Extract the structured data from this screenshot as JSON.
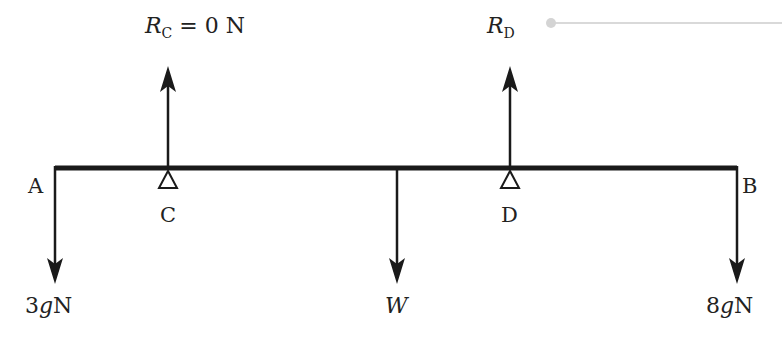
{
  "diagram": {
    "type": "beam-force-diagram",
    "colors": {
      "ink": "#1a1a1a",
      "text": "#222222",
      "faint_line": "#d4d4d4"
    },
    "beam": {
      "left_label": "A",
      "right_label": "B"
    },
    "supports": [
      {
        "label": "C"
      },
      {
        "label": "D"
      }
    ],
    "reactions": [
      {
        "symbol": "R",
        "subscript": "C",
        "value_text": " = 0 N"
      },
      {
        "symbol": "R",
        "subscript": "D",
        "value_text": ""
      }
    ],
    "loads": [
      {
        "label_num": "3",
        "label_var": "g",
        "label_unit": "N",
        "at": "A"
      },
      {
        "label_var": "W",
        "at": "centre"
      },
      {
        "label_num": "8",
        "label_var": "g",
        "label_unit": "N",
        "at": "B"
      }
    ]
  }
}
